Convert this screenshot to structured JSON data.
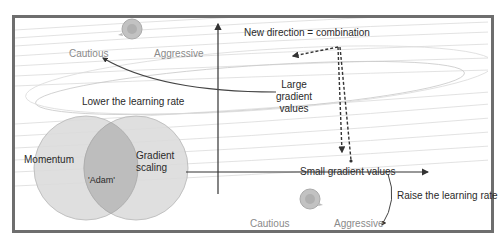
{
  "diagram": {
    "title_label": "New direction = combination",
    "top_speed": {
      "cautious": "Cautious",
      "aggressive": "Aggressive"
    },
    "bottom_speed": {
      "cautious": "Cautious",
      "aggressive": "Aggressive"
    },
    "lower_rate": "Lower the learning rate",
    "raise_rate": "Raise the learning rate",
    "large_gradient": {
      "line1": "Large",
      "line2": "gradient",
      "line3": "values"
    },
    "small_gradient": "Small gradient values",
    "venn": {
      "left": "Momentum",
      "right": {
        "line1": "Gradient",
        "line2": "scaling"
      },
      "intersection": "'Adam'"
    },
    "icons": [
      "snail-icon-top",
      "snail-icon-bottom"
    ],
    "colors": {
      "frame": "#6e6e6e",
      "contour": "#d8d8d8",
      "venn_fill": "#d9d9d9",
      "venn_overlap": "#bdbdbd",
      "speed_label": "#8a8a8a",
      "text": "#2a2a2a"
    }
  }
}
